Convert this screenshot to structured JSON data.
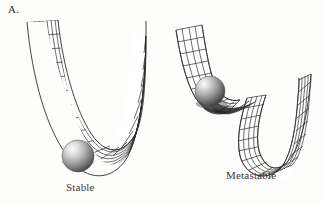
{
  "figure": {
    "panel_letter": "A.",
    "background_color": "#fdfdfc",
    "mesh_line_color": "#2f2f2f",
    "sphere_colors": {
      "highlight": "#f2f2f2",
      "midtone": "#9a9a9a",
      "shadow": "#3c3c3c"
    }
  },
  "panels": [
    {
      "id": "stable",
      "caption": "Stable",
      "description": "symmetric single-well mesh surface with sphere resting at the lowest point"
    },
    {
      "id": "metastable",
      "caption": "Metastable",
      "description": "asymmetric mesh surface with a shallow upper ledge holding the sphere above a deeper valley"
    }
  ],
  "diagram_data": {
    "type": "energy-landscape",
    "wells": [
      {
        "name": "Stable",
        "minima": 1,
        "ball_position": "global-minimum",
        "ball_depth_label": "lowest point of the well"
      },
      {
        "name": "Metastable",
        "minima": 2,
        "ball_position": "local-minimum",
        "ball_depth_label": "shallow ledge above the deeper valley"
      }
    ]
  }
}
